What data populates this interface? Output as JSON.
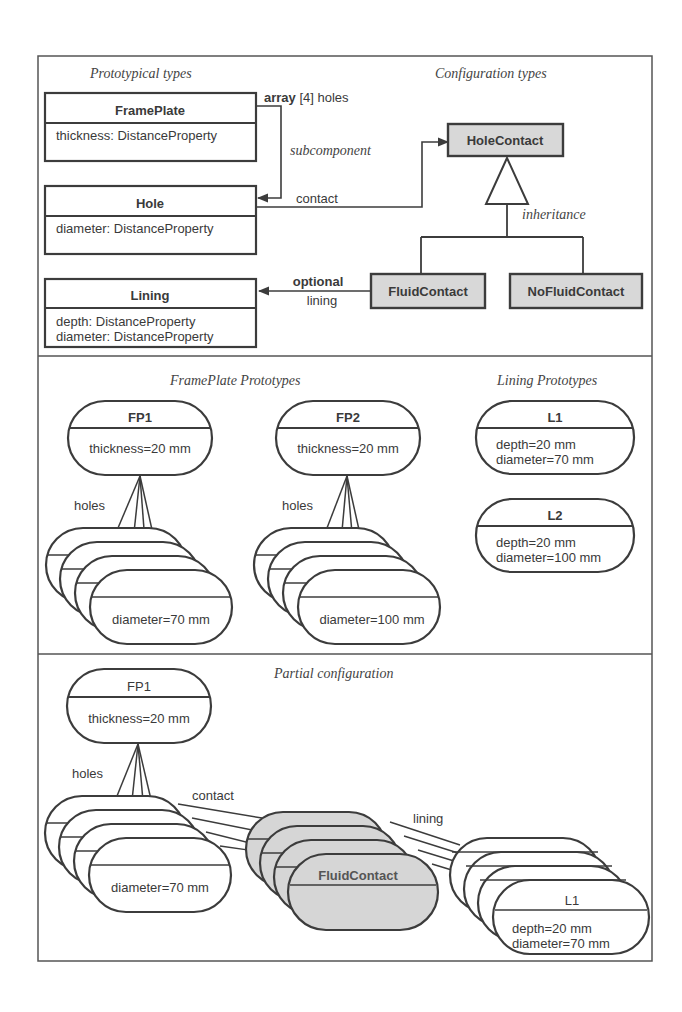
{
  "sections": {
    "top": {
      "left_heading": "Prototypical types",
      "right_heading": "Configuration types"
    },
    "middle": {
      "left_heading": "FramePlate Prototypes",
      "right_heading": "Lining Prototypes"
    },
    "bottom": {
      "heading": "Partial configuration"
    }
  },
  "types": {
    "frameplate": {
      "name": "FramePlate",
      "attrs": [
        "thickness: DistanceProperty"
      ]
    },
    "hole": {
      "name": "Hole",
      "attrs": [
        "diameter: DistanceProperty"
      ]
    },
    "lining": {
      "name": "Lining",
      "attrs": [
        "depth: DistanceProperty",
        "diameter: DistanceProperty"
      ]
    }
  },
  "config_types": {
    "holecontact": "HoleContact",
    "fluidcontact": "FluidContact",
    "nofluidcontact": "NoFluidContact"
  },
  "relations": {
    "array_bold": "array",
    "array_rest": " [4] holes",
    "subcomponent": "subcomponent",
    "contact": "contact",
    "inheritance": "inheritance",
    "optional": "optional",
    "lining": "lining"
  },
  "prototypes": {
    "fp1": {
      "name": "FP1",
      "attr": "thickness=20 mm",
      "holes_label": "holes",
      "hole_attr": "diameter=70 mm"
    },
    "fp2": {
      "name": "FP2",
      "attr": "thickness=20 mm",
      "holes_label": "holes",
      "hole_attr": "diameter=100 mm"
    },
    "l1": {
      "name": "L1",
      "attrs": [
        "depth=20 mm",
        "diameter=70 mm"
      ]
    },
    "l2": {
      "name": "L2",
      "attrs": [
        "depth=20 mm",
        "diameter=100 mm"
      ]
    }
  },
  "partial": {
    "fp_name": "FP1",
    "fp_attr": "thickness=20 mm",
    "holes_label": "holes",
    "hole_attr": "diameter=70 mm",
    "contact_label": "contact",
    "contact_name": "FluidContact",
    "lining_label": "lining",
    "lining_name": "L1",
    "lining_attrs": [
      "depth=20 mm",
      "diameter=70 mm"
    ]
  }
}
